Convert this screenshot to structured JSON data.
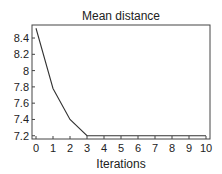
{
  "chart_data": {
    "type": "line",
    "title": "Mean distance",
    "xlabel": "Iterations",
    "ylabel": "",
    "x": [
      0,
      1,
      2,
      3,
      4,
      5,
      6,
      7,
      8,
      9,
      10
    ],
    "series": [
      {
        "name": "Mean distance",
        "values": [
          8.52,
          7.78,
          7.4,
          7.2,
          7.2,
          7.2,
          7.2,
          7.2,
          7.2,
          7.2,
          7.2
        ]
      }
    ],
    "xlim": [
      0,
      10
    ],
    "ylim": [
      7.16,
      8.56
    ],
    "xticks": [
      "0",
      "1",
      "2",
      "3",
      "4",
      "5",
      "6",
      "7",
      "8",
      "9",
      "10"
    ],
    "yticks": [
      "7.2",
      "7.4",
      "7.6",
      "7.8",
      "8",
      "8.2",
      "8.4"
    ],
    "ytick_values": [
      7.2,
      7.4,
      7.6,
      7.8,
      8.0,
      8.2,
      8.4
    ],
    "grid": false,
    "legend": "none",
    "colors": {
      "line": "#333333",
      "frame": "#444444",
      "text": "#222222"
    }
  }
}
